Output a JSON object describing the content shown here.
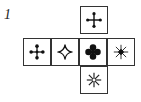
{
  "figure": {
    "label": "1",
    "type": "cube-net",
    "faces": [
      {
        "position": "top",
        "symbol": "dotted-cross-icon"
      },
      {
        "position": "middle-1",
        "symbol": "four-dot-cross-icon"
      },
      {
        "position": "middle-2",
        "symbol": "four-point-star-outline-icon"
      },
      {
        "position": "middle-3",
        "symbol": "clover-icon"
      },
      {
        "position": "middle-4",
        "symbol": "asterisk-dark-center-icon"
      },
      {
        "position": "bottom",
        "symbol": "eight-ray-asterisk-icon"
      }
    ],
    "stroke_color": "#333333"
  }
}
